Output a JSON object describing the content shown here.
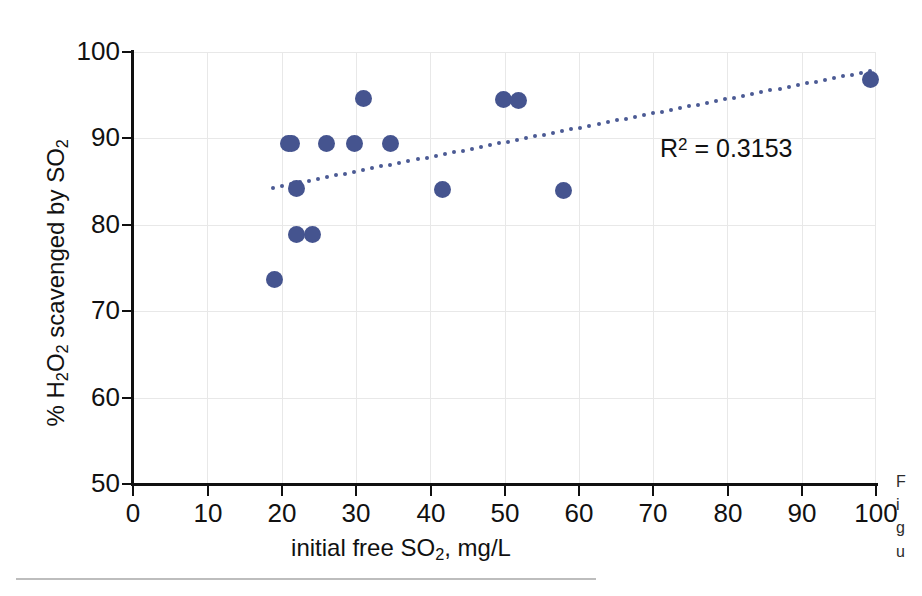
{
  "chart_data": {
    "type": "scatter",
    "title": "",
    "xlabel": "initial free SO2, mg/L",
    "ylabel": "% H2O2 scavenged by SO2",
    "xlim": [
      0,
      100
    ],
    "ylim": [
      50,
      100
    ],
    "xticks": [
      0,
      10,
      20,
      30,
      40,
      50,
      60,
      70,
      80,
      90,
      100
    ],
    "yticks": [
      50,
      60,
      70,
      80,
      90,
      100
    ],
    "grid": true,
    "legend": "none",
    "marker_color": "#45548f",
    "trendline_color": "#4b5a94",
    "annotation": "R² = 0.3153",
    "r_squared": 0.3153,
    "x": [
      19.0,
      20.9,
      21.3,
      22.0,
      22.0,
      24.1,
      26.1,
      29.8,
      31.0,
      34.6,
      41.7,
      49.8,
      51.9,
      58.0,
      99.3
    ],
    "y": [
      73.7,
      89.4,
      89.4,
      84.2,
      78.9,
      78.9,
      89.4,
      89.4,
      94.6,
      89.4,
      84.1,
      94.5,
      94.4,
      84.0,
      96.8
    ],
    "points": [
      {
        "x": 19.0,
        "y": 73.7
      },
      {
        "x": 20.9,
        "y": 89.4
      },
      {
        "x": 21.3,
        "y": 89.4
      },
      {
        "x": 22.0,
        "y": 84.2
      },
      {
        "x": 22.0,
        "y": 78.9
      },
      {
        "x": 24.1,
        "y": 78.9
      },
      {
        "x": 26.1,
        "y": 89.4
      },
      {
        "x": 29.8,
        "y": 89.4
      },
      {
        "x": 31.0,
        "y": 94.6
      },
      {
        "x": 34.6,
        "y": 89.4
      },
      {
        "x": 41.7,
        "y": 84.1
      },
      {
        "x": 49.8,
        "y": 94.5
      },
      {
        "x": 51.9,
        "y": 94.4
      },
      {
        "x": 58.0,
        "y": 84.0
      },
      {
        "x": 99.3,
        "y": 96.8
      }
    ],
    "trendline": {
      "style": "dotted",
      "x_start": 18.8,
      "y_start": 84.3,
      "x_end": 99.2,
      "y_end": 97.8
    }
  },
  "axis": {
    "y_tick_labels": [
      "100",
      "90",
      "80",
      "70",
      "60",
      "50"
    ],
    "x_tick_labels": [
      "0",
      "10",
      "20",
      "30",
      "40",
      "50",
      "60",
      "70",
      "80",
      "90",
      "100"
    ],
    "x_title_parts": {
      "pre": "initial free SO",
      "sub": "2",
      "post": ", mg/L"
    },
    "y_title_parts": {
      "p1": "% H",
      "s1": "2",
      "p2": "O",
      "s2": "2",
      "p3": " scavenged by SO",
      "s3": "2"
    }
  },
  "annotation": {
    "r2_prefix": "R",
    "r2_sup": "2",
    "r2_value": " = 0.3153"
  },
  "page": {
    "margin_note": "Figure"
  }
}
